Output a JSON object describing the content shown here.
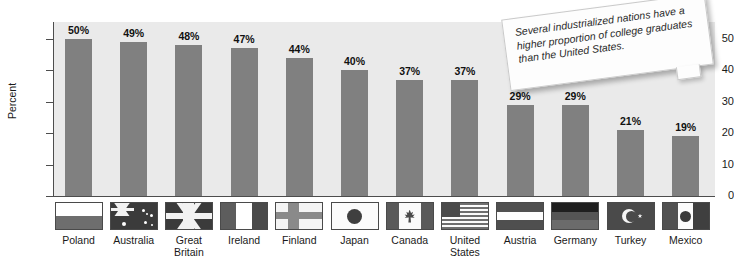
{
  "chart_data": {
    "type": "bar",
    "title": "",
    "xlabel": "",
    "ylabel": "Percent",
    "ylim": [
      0,
      55
    ],
    "yticks": [
      0,
      10,
      20,
      30,
      40,
      50
    ],
    "grid": false,
    "legend": null,
    "value_suffix": "%",
    "categories": [
      "Poland",
      "Australia",
      "Great Britain",
      "Ireland",
      "Finland",
      "Japan",
      "Canada",
      "United States",
      "Austria",
      "Germany",
      "Turkey",
      "Mexico"
    ],
    "values": [
      50,
      49,
      48,
      47,
      44,
      40,
      37,
      37,
      29,
      29,
      21,
      19
    ],
    "value_labels": [
      "50%",
      "49%",
      "48%",
      "47%",
      "44%",
      "40%",
      "37%",
      "37%",
      "29%",
      "29%",
      "21%",
      "19%"
    ],
    "annotations": [
      "Several industrialized nations have a higher proportion of college graduates than the United States."
    ],
    "colors": {
      "bar": "#808080",
      "plot_background": "#eaeaea",
      "page_background": "#ffffff",
      "axis": "#4d4d4d",
      "text": "#1a1a1a"
    }
  },
  "axis": {
    "y_title": "Percent",
    "y_tick_labels": [
      "50",
      "40",
      "30",
      "20",
      "10",
      "0"
    ]
  },
  "bars": [
    {
      "country": "Poland",
      "label": "Poland",
      "value_label": "50%",
      "value": 50,
      "flag": "poland-flag"
    },
    {
      "country": "Australia",
      "label": "Australia",
      "value_label": "49%",
      "value": 49,
      "flag": "australia-flag"
    },
    {
      "country": "Great Britain",
      "label": "Great Britain",
      "value_label": "48%",
      "value": 48,
      "flag": "great-britain-flag"
    },
    {
      "country": "Ireland",
      "label": "Ireland",
      "value_label": "47%",
      "value": 47,
      "flag": "ireland-flag"
    },
    {
      "country": "Finland",
      "label": "Finland",
      "value_label": "44%",
      "value": 44,
      "flag": "finland-flag"
    },
    {
      "country": "Japan",
      "label": "Japan",
      "value_label": "40%",
      "value": 40,
      "flag": "japan-flag"
    },
    {
      "country": "Canada",
      "label": "Canada",
      "value_label": "37%",
      "value": 37,
      "flag": "canada-flag"
    },
    {
      "country": "United States",
      "label": "United States",
      "value_label": "37%",
      "value": 37,
      "flag": "united-states-flag"
    },
    {
      "country": "Austria",
      "label": "Austria",
      "value_label": "29%",
      "value": 29,
      "flag": "austria-flag"
    },
    {
      "country": "Germany",
      "label": "Germany",
      "value_label": "29%",
      "value": 29,
      "flag": "germany-flag"
    },
    {
      "country": "Turkey",
      "label": "Turkey",
      "value_label": "21%",
      "value": 21,
      "flag": "turkey-flag"
    },
    {
      "country": "Mexico",
      "label": "Mexico",
      "value_label": "19%",
      "value": 19,
      "flag": "mexico-flag"
    }
  ],
  "callout": {
    "text": "Several industrialized nations have a higher proportion of college graduates than the United States."
  }
}
